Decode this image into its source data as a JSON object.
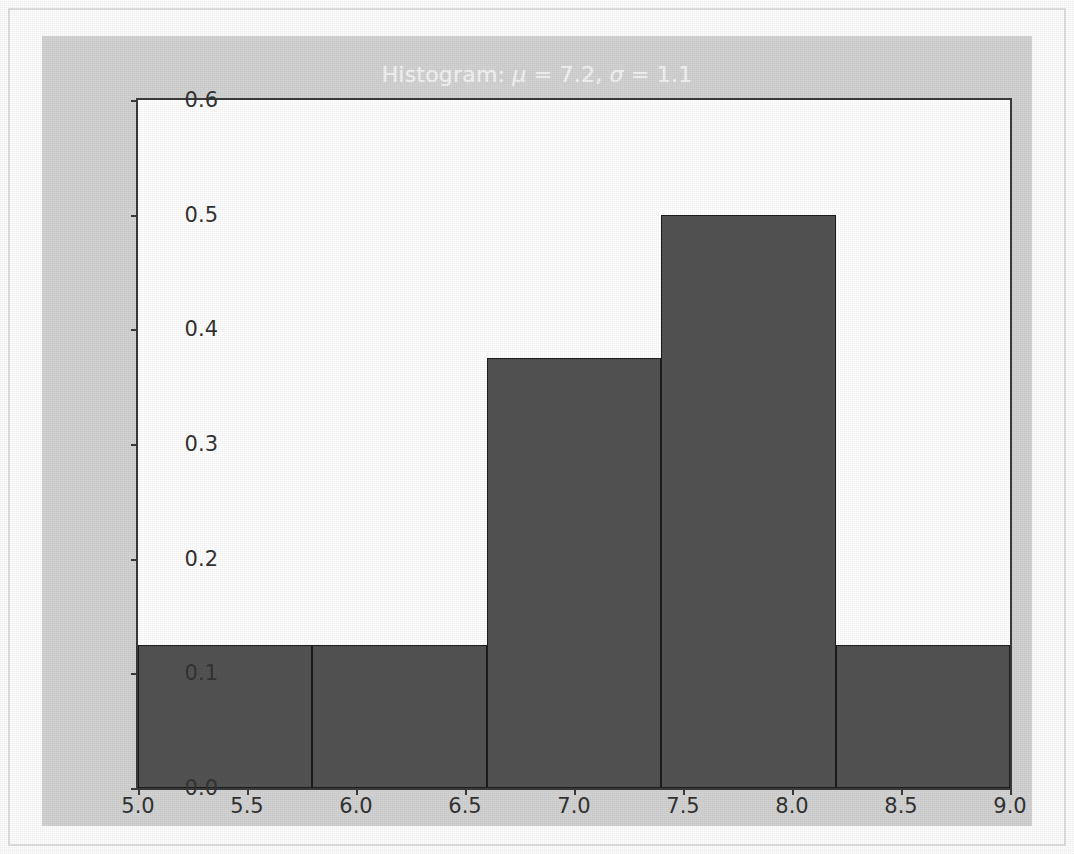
{
  "figure": {
    "background_color": "#d3d3d3",
    "axes_background_color": "#ffffff",
    "title_color": "#f2f2f2",
    "bar_color": "#535353",
    "bar_edge_color": "#1c1c1c",
    "axis_color": "#3b3b3b"
  },
  "chart_data": {
    "type": "bar",
    "title": "Histogram: μ = 7.2, σ = 1.1",
    "title_parts": {
      "prefix": "Histogram: ",
      "mu_symbol": "μ",
      "mu_equals": " = ",
      "mu_value": "7.2",
      "separator": ", ",
      "sigma_symbol": "σ",
      "sigma_equals": " = ",
      "sigma_value": "1.1"
    },
    "xlabel": "",
    "ylabel": "",
    "xlim": [
      5.0,
      9.0
    ],
    "ylim": [
      0.0,
      0.6
    ],
    "grid": false,
    "legend": null,
    "xticks": [
      "5.0",
      "5.5",
      "6.0",
      "6.5",
      "7.0",
      "7.5",
      "8.0",
      "8.5",
      "9.0"
    ],
    "xtick_values": [
      5.0,
      5.5,
      6.0,
      6.5,
      7.0,
      7.5,
      8.0,
      8.5,
      9.0
    ],
    "yticks": [
      "0.0",
      "0.1",
      "0.2",
      "0.3",
      "0.4",
      "0.5",
      "0.6"
    ],
    "ytick_values": [
      0.0,
      0.1,
      0.2,
      0.3,
      0.4,
      0.5,
      0.6
    ],
    "bin_edges": [
      5.0,
      5.8,
      6.6,
      7.4,
      8.2,
      9.0
    ],
    "bin_centers": [
      5.4,
      6.2,
      7.0,
      7.8,
      8.6
    ],
    "categories": [
      "5.0-5.8",
      "5.8-6.6",
      "6.6-7.4",
      "7.4-8.2",
      "8.2-9.0"
    ],
    "values": [
      0.125,
      0.125,
      0.375,
      0.5,
      0.125
    ],
    "ylabel_units": "density"
  }
}
